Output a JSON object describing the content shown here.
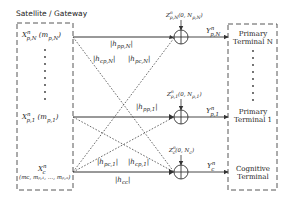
{
  "diagram": {
    "source_box": {
      "title": "Satellite / Gateway",
      "signals": {
        "primary_n": {
          "symbol": "X",
          "sup": "n",
          "sub": "p,N",
          "message": "(m",
          "message_sub": "p,N",
          "message_close": ")"
        },
        "primary_1": {
          "symbol": "X",
          "sup": "n",
          "sub": "p,1",
          "message": "(m",
          "message_sub": "p,1",
          "message_close": ")"
        },
        "cognitive": {
          "symbol": "X",
          "sup": "n",
          "sub": "c",
          "messages": "(mᴄ, mₚ,₁, …, mₚ,ₙ)"
        }
      }
    },
    "channel_gains": {
      "hpp_N": "|h",
      "hpp_N_sub": "pp,N",
      "hcp_N_sub": "cp,N",
      "hpc_N_sub": "pc,N",
      "hpp_1_sub": "pp,1",
      "hpc_1_sub": "pc,1",
      "hcp_1_sub": "cp,1",
      "hcc_sub": "cc",
      "bar": "|"
    },
    "noise": {
      "primary_n": {
        "symbol": "Z",
        "sup": "n",
        "sub": "p,N",
        "args": "(0, N",
        "args_sub": "p,N",
        "close": ")"
      },
      "primary_1": {
        "symbol": "Z",
        "sup": "n",
        "sub": "p,1",
        "args": "(0, N",
        "args_sub": "p,1",
        "close": ")"
      },
      "cognitive": {
        "symbol": "Z",
        "sup": "n",
        "sub": "c",
        "args": "(0, N",
        "args_sub": "c",
        "close": ")"
      }
    },
    "outputs": {
      "primary_n": {
        "symbol": "Y",
        "sup": "n",
        "sub": "p,N"
      },
      "primary_1": {
        "symbol": "Y",
        "sup": "n",
        "sub": "p,1"
      },
      "cognitive": {
        "symbol": "Y",
        "sup": "n",
        "sub": "c"
      }
    },
    "terminals": {
      "primary_n": [
        "Primary",
        "Terminal N"
      ],
      "primary_1": [
        "Primary",
        "Terminal 1"
      ],
      "cognitive": [
        "Cognitive",
        "Terminal"
      ]
    },
    "adder_symbol": "⊕",
    "ellipsis": "⋮"
  }
}
